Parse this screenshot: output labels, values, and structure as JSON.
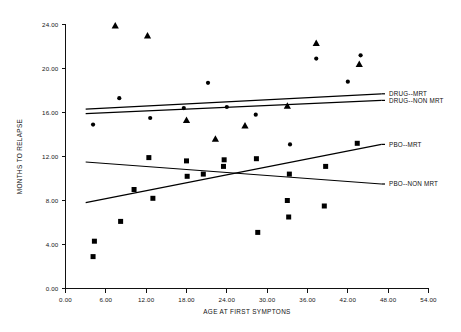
{
  "chart_data": {
    "type": "scatter",
    "title": "",
    "xlabel": "AGE AT FIRST SYMPTONS",
    "ylabel": "MONTHS TO RELAPSE",
    "xlim": [
      0.0,
      54.0
    ],
    "ylim": [
      0.0,
      24.0
    ],
    "xticks": [
      "0.00",
      "6.00",
      "12.00",
      "18.00",
      "24.00",
      "30.00",
      "36.00",
      "42.00",
      "48.00",
      "54.00"
    ],
    "yticks": [
      "0.00",
      "4.00",
      "8.00",
      "12.00",
      "16.00",
      "20.00",
      "24.00"
    ],
    "xtick_values": [
      0,
      6,
      12,
      18,
      24,
      30,
      36,
      42,
      48,
      54
    ],
    "ytick_values": [
      0,
      4,
      8,
      12,
      16,
      20,
      24
    ],
    "grid": false,
    "legend_position": "right-inline",
    "series": [
      {
        "name": "DRUG--MRT",
        "marker": "triangle",
        "points": [
          [
            7.4,
            23.9
          ],
          [
            12.2,
            23.0
          ],
          [
            18.0,
            15.3
          ],
          [
            22.3,
            13.6
          ],
          [
            26.7,
            14.8
          ],
          [
            33.0,
            16.6
          ],
          [
            37.3,
            22.3
          ],
          [
            43.7,
            20.4
          ]
        ],
        "fit": {
          "x0": 3.0,
          "y0": 16.3,
          "x1": 47.0,
          "y1": 17.7
        }
      },
      {
        "name": "DRUG--NON MRT",
        "marker": "circle",
        "points": [
          [
            4.1,
            14.9
          ],
          [
            8.0,
            17.3
          ],
          [
            12.6,
            15.5
          ],
          [
            17.6,
            16.4
          ],
          [
            21.2,
            18.7
          ],
          [
            24.0,
            16.5
          ],
          [
            28.3,
            15.8
          ],
          [
            33.4,
            13.1
          ],
          [
            37.3,
            20.9
          ],
          [
            42.0,
            18.8
          ],
          [
            43.9,
            21.2
          ]
        ],
        "fit": {
          "x0": 3.0,
          "y0": 15.9,
          "x1": 47.0,
          "y1": 17.1
        }
      },
      {
        "name": "PBO--MRT",
        "marker": "square",
        "points": [
          [
            4.3,
            4.3
          ],
          [
            4.1,
            2.9
          ],
          [
            8.2,
            6.1
          ],
          [
            12.4,
            11.9
          ],
          [
            13.0,
            8.2
          ],
          [
            18.0,
            11.6
          ],
          [
            18.1,
            10.2
          ],
          [
            23.6,
            11.7
          ],
          [
            23.5,
            11.1
          ],
          [
            28.4,
            11.8
          ],
          [
            33.3,
            10.4
          ],
          [
            38.7,
            11.1
          ],
          [
            43.4,
            13.2
          ]
        ],
        "fit": {
          "x0": 3.0,
          "y0": 7.8,
          "x1": 47.0,
          "y1": 13.1
        }
      },
      {
        "name": "PBO--NON MRT",
        "marker": "square",
        "points": [
          [
            10.2,
            9.0
          ],
          [
            20.5,
            10.4
          ],
          [
            28.6,
            5.1
          ],
          [
            33.0,
            8.0
          ],
          [
            33.2,
            6.5
          ],
          [
            38.5,
            7.5
          ]
        ],
        "fit": {
          "x0": 3.0,
          "y0": 11.5,
          "x1": 47.0,
          "y1": 9.5
        }
      }
    ],
    "legend": [
      {
        "label": "DRUG--MRT",
        "anchor_y": 17.7
      },
      {
        "label": "DRUG--NON MRT",
        "anchor_y": 17.1
      },
      {
        "label": "PBO--MRT",
        "anchor_y": 13.1
      },
      {
        "label": "PBO--NON MRT",
        "anchor_y": 9.5
      }
    ]
  }
}
